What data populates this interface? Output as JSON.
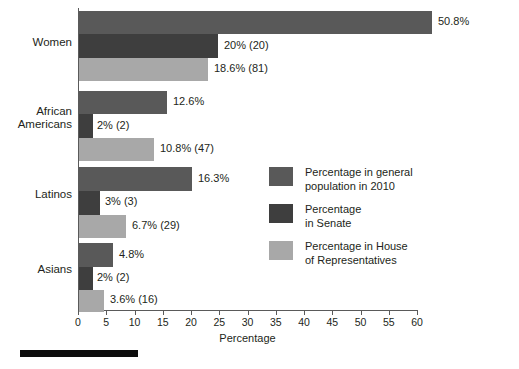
{
  "chart_data": {
    "type": "bar",
    "orientation": "horizontal",
    "title": "",
    "xlabel": "Percentage",
    "ylabel": "",
    "xlim": [
      0,
      60
    ],
    "xticks": [
      0,
      5,
      10,
      15,
      20,
      25,
      30,
      35,
      40,
      45,
      50,
      55,
      60
    ],
    "grid": false,
    "legend_position": "inside-right",
    "categories": [
      "Women",
      "African\nAmericans",
      "Latinos",
      "Asians"
    ],
    "series": [
      {
        "name": "Percentage in general\npopulation in 2010",
        "color": "#595959",
        "values": [
          50.8,
          12.6,
          16.3,
          4.8
        ],
        "labels": [
          "50.8%",
          "12.6%",
          "16.3%",
          "4.8%"
        ]
      },
      {
        "name": "Percentage\nin Senate",
        "color": "#3e3e3e",
        "values": [
          20,
          2,
          3,
          2
        ],
        "labels": [
          "20% (20)",
          "2% (2)",
          "3% (3)",
          "2% (2)"
        ]
      },
      {
        "name": "Percentage in House\nof Representatives",
        "color": "#a8a8a8",
        "values": [
          18.6,
          10.8,
          6.7,
          3.6
        ],
        "labels": [
          "18.6% (81)",
          "10.8% (47)",
          "6.7% (29)",
          "3.6% (16)"
        ]
      }
    ]
  },
  "axis": {
    "x_title": "Percentage",
    "tick_labels": [
      "0",
      "5",
      "10",
      "15",
      "20",
      "25",
      "30",
      "35",
      "40",
      "45",
      "50",
      "55",
      "60"
    ]
  },
  "categories": [
    {
      "label": "Women",
      "line1": "Women",
      "line2": ""
    },
    {
      "label": "African Americans",
      "line1": "African",
      "line2": "Americans"
    },
    {
      "label": "Latinos",
      "line1": "Latinos",
      "line2": ""
    },
    {
      "label": "Asians",
      "line1": "Asians",
      "line2": ""
    }
  ],
  "bar_labels": {
    "women": {
      "general": "50.8%",
      "senate": "20% (20)",
      "house": "18.6% (81)"
    },
    "african_americans": {
      "general": "12.6%",
      "senate": "2% (2)",
      "house": "10.8% (47)"
    },
    "latinos": {
      "general": "16.3%",
      "senate": "3% (3)",
      "house": "6.7% (29)"
    },
    "asians": {
      "general": "4.8%",
      "senate": "2% (2)",
      "house": "3.6% (16)"
    }
  },
  "legend": {
    "items": [
      {
        "label": "Percentage in general\npopulation in 2010",
        "color": "#595959"
      },
      {
        "label": "Percentage\nin Senate",
        "color": "#3e3e3e"
      },
      {
        "label": "Percentage in House\nof Representatives",
        "color": "#a8a8a8"
      }
    ]
  },
  "colors": {
    "series_general": "#595959",
    "series_senate": "#3e3e3e",
    "series_house": "#a8a8a8",
    "axis": "#5a5a5a",
    "text": "#231f20",
    "background": "#ffffff",
    "rule": "#0d0d0d"
  }
}
